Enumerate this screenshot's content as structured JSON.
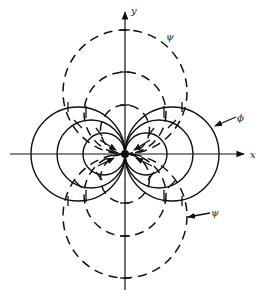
{
  "figure": {
    "axes": {
      "x_label": "x",
      "y_label": "y"
    },
    "labels": {
      "psi_top": "ψ",
      "phi_right": "ϕ",
      "psi_bottom": "ψ"
    },
    "potential_lines_phi": {
      "style": "solid",
      "radii": [
        47,
        34,
        21
      ]
    },
    "stream_lines_psi": {
      "style": "dashed",
      "radii": [
        62,
        41,
        24
      ]
    },
    "colors": {
      "ink": "#111111",
      "background": "#ffffff"
    }
  }
}
